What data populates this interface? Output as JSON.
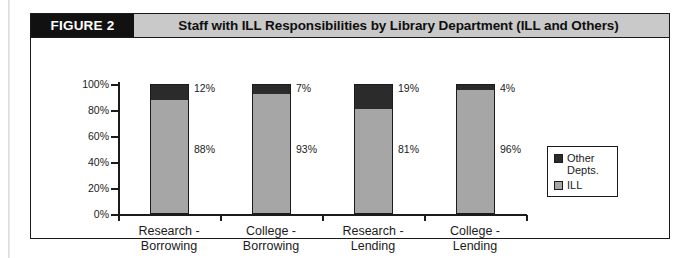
{
  "figure": {
    "tag": "FIGURE 2",
    "title": "Staff with ILL Responsibilities by Library Department (ILL and Others)"
  },
  "colors": {
    "other_depts": "#2b2b2b",
    "ill": "#a6a6a6",
    "header_band": "#c9c9c9",
    "tag_background": "#111111",
    "axis": "#1b1b1b"
  },
  "chart_data": {
    "type": "bar",
    "stacked": true,
    "title": "Staff with ILL Responsibilities by Library Department (ILL and Others)",
    "xlabel": "",
    "ylabel": "",
    "ylim": [
      0,
      100
    ],
    "yticks": [
      "0%",
      "20%",
      "40%",
      "60%",
      "80%",
      "100%"
    ],
    "ytick_values": [
      0,
      20,
      40,
      60,
      80,
      100
    ],
    "grid": false,
    "legend_position": "right",
    "categories": [
      "Research - Borrowing",
      "College - Borrowing",
      "Research - Lending",
      "College - Lending"
    ],
    "category_lines": [
      [
        "Research -",
        "Borrowing"
      ],
      [
        "College -",
        "Borrowing"
      ],
      [
        "Research -",
        "Lending"
      ],
      [
        "College -",
        "Lending"
      ]
    ],
    "series": [
      {
        "name": "ILL",
        "color": "#a6a6a6",
        "values": [
          88,
          93,
          81,
          96
        ],
        "labels": [
          "88%",
          "93%",
          "81%",
          "96%"
        ]
      },
      {
        "name": "Other Depts.",
        "color": "#2b2b2b",
        "values": [
          12,
          7,
          19,
          4
        ],
        "labels": [
          "12%",
          "7%",
          "19%",
          "4%"
        ]
      }
    ]
  },
  "legend": {
    "items": [
      {
        "label_line1": "Other",
        "label_line2": "Depts.",
        "swatch": "other"
      },
      {
        "label_line1": "ILL",
        "label_line2": "",
        "swatch": "ill"
      }
    ]
  }
}
